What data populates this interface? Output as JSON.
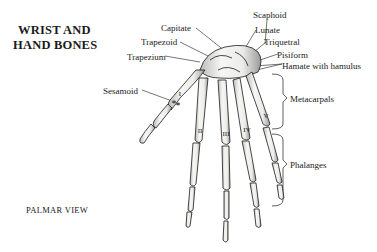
{
  "title": {
    "line1": "WRIST AND",
    "line2": "HAND BONES"
  },
  "caption": "PALMAR VIEW",
  "labels": {
    "scaphoid": "Scaphoid",
    "capitate": "Capitate",
    "lunate": "Lunate",
    "trapezoid": "Trapezoid",
    "triquetral": "Triquetral",
    "trapezium": "Trapezium",
    "pisiform": "Pisiform",
    "hamate": "Hamate with hamulus",
    "sesamoid": "Sesamoid",
    "metacarpals": "Metacarpals",
    "phalanges": "Phalanges"
  },
  "metacarpal_numerals": [
    "I",
    "II",
    "III",
    "IV",
    "V"
  ],
  "colors": {
    "ink": "#1a1a1a",
    "bone": "#f4f4f2",
    "shade": "#8a8a8a",
    "background": "#ffffff"
  }
}
